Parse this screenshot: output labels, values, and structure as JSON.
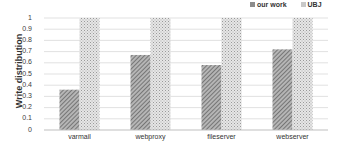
{
  "chart_data": {
    "type": "bar",
    "title": "",
    "xlabel": "",
    "ylabel": "Write distribution",
    "ylim": [
      0,
      1
    ],
    "yticks": [
      "0",
      "0.1",
      "0.2",
      "0.3",
      "0.4",
      "0.5",
      "0.6",
      "0.7",
      "0.8",
      "0.9",
      "1"
    ],
    "grid": true,
    "legend_position": "top-right",
    "categories": [
      "varmail",
      "webproxy",
      "fileserver",
      "webserver"
    ],
    "series": [
      {
        "name": "our work",
        "values": [
          0.36,
          0.67,
          0.58,
          0.72
        ],
        "color": "#8c8c8c",
        "pattern": "dense-diagonal-hatch"
      },
      {
        "name": "UBJ",
        "values": [
          1.0,
          1.0,
          1.0,
          1.0
        ],
        "color": "#c8c8c8",
        "pattern": "light-crosshatch"
      }
    ]
  }
}
